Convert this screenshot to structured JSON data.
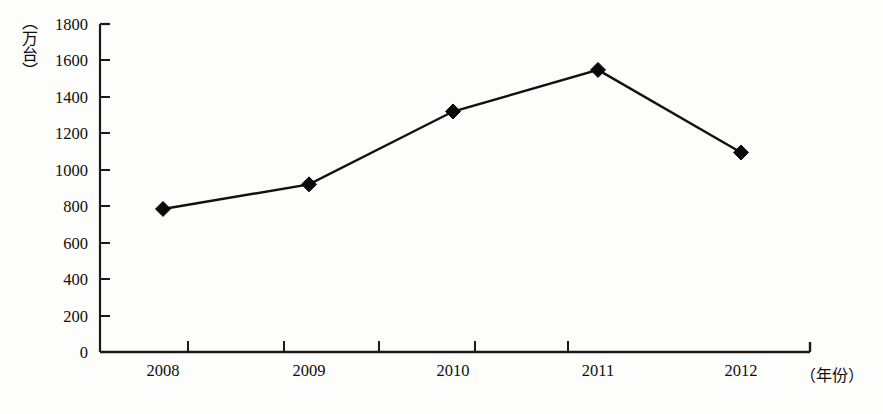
{
  "chart_data": {
    "type": "line",
    "title": "",
    "subtitle": "",
    "xlabel": "（年份）",
    "ylabel": "（万台）",
    "categories": [
      "2008",
      "2009",
      "2010",
      "2011",
      "2012"
    ],
    "values": [
      785,
      920,
      1320,
      1548,
      1095
    ],
    "series": [
      {
        "name": "",
        "values": [
          785,
          920,
          1320,
          1548,
          1095
        ],
        "marker": "diamond",
        "color": "#111111"
      }
    ],
    "ylim": [
      0,
      1800
    ],
    "ytick_labels": [
      "1800",
      "1600",
      "1400",
      "1200",
      "1000",
      "800",
      "600",
      "400",
      "200",
      "0"
    ],
    "ytick_values": [
      1800,
      1600,
      1400,
      1200,
      1000,
      800,
      600,
      400,
      200,
      0
    ],
    "xtick_labels": [
      "2008",
      "2009",
      "2010",
      "2011",
      "2012"
    ],
    "grid": false,
    "legend": false,
    "legend_position": "none",
    "annotations": []
  },
  "axes": {
    "y_unit_label": "（万台）",
    "x_unit_label": "（年份）"
  },
  "colors": {
    "line": "#111111",
    "marker": "#0a0a0a",
    "axis": "#1a1a1a",
    "background": "#fdfdfc",
    "text": "#0d0d0d"
  }
}
